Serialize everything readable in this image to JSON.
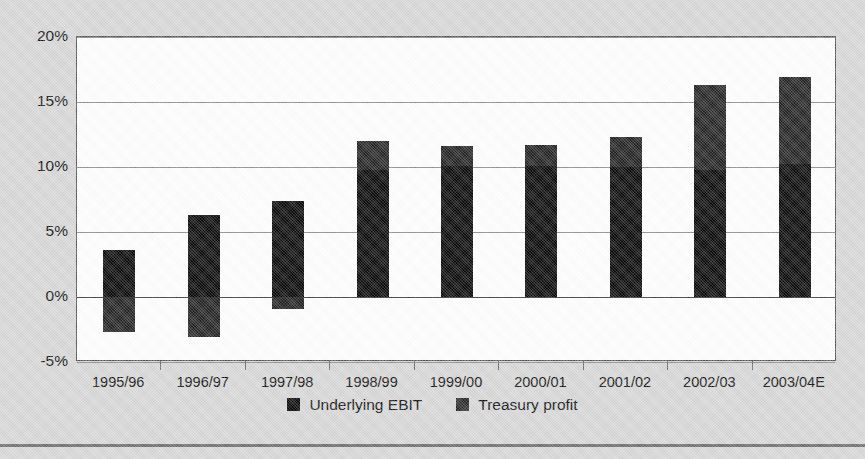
{
  "chart_data": {
    "type": "bar",
    "stacked": true,
    "title": "",
    "subtitle": "",
    "xlabel": "",
    "ylabel": "",
    "grid": true,
    "legend_position": "bottom",
    "ylim": [
      -5,
      20
    ],
    "yticks": [
      20,
      15,
      10,
      5,
      0,
      -5
    ],
    "ytick_labels": [
      "20%",
      "15%",
      "10%",
      "5%",
      "0%",
      "-5%"
    ],
    "categories": [
      "1995/96",
      "1996/97",
      "1997/98",
      "1998/99",
      "1999/00",
      "2000/01",
      "2001/02",
      "2002/03",
      "2003/04E"
    ],
    "series": [
      {
        "name": "Underlying EBIT",
        "color": "#0b0b0b",
        "values": [
          3.6,
          6.3,
          7.4,
          9.8,
          10.1,
          10.1,
          10.0,
          9.8,
          10.2
        ]
      },
      {
        "name": "Treasury profit",
        "color": "#2b2b2b",
        "values": [
          -2.7,
          -3.1,
          -0.9,
          2.2,
          1.5,
          1.6,
          2.3,
          6.5,
          6.7
        ]
      }
    ],
    "bar_totals": [
      0.9,
      3.2,
      6.5,
      12.0,
      11.6,
      11.7,
      12.3,
      16.3,
      16.9
    ],
    "bar_tops": [
      3.6,
      6.3,
      7.4,
      12.0,
      11.6,
      11.7,
      12.3,
      16.3,
      16.9
    ],
    "bar_bottoms": [
      -2.7,
      -3.1,
      -0.9,
      0,
      0,
      0,
      0,
      0,
      0
    ]
  },
  "legend": {
    "items": [
      {
        "label": "Underlying EBIT",
        "swatch": "ebit"
      },
      {
        "label": "Treasury profit",
        "swatch": "treasury"
      }
    ]
  },
  "axis": {
    "y_labels": [
      "20%",
      "15%",
      "10%",
      "5%",
      "0%",
      "-5%"
    ],
    "x_labels": [
      "1995/96",
      "1996/97",
      "1997/98",
      "1998/99",
      "1999/00",
      "2000/01",
      "2001/02",
      "2002/03",
      "2003/04E"
    ]
  },
  "colors": {
    "background": "#d8d8d8",
    "plot_background": "#ffffff",
    "ebit": "#0b0b0b",
    "treasury": "#2b2b2b",
    "gridline": "#8c8c8c",
    "axis": "#3a3a3a"
  }
}
